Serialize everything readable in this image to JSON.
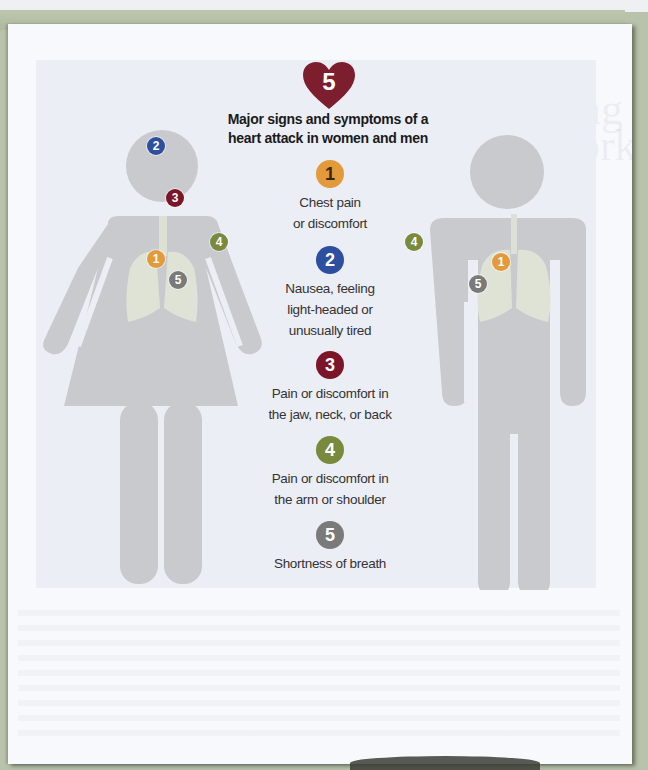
{
  "figure": {
    "heart_number": "5",
    "title_line1": "Major signs and symptoms of a",
    "title_line2": "heart attack in women and men",
    "colors": {
      "heart": "#7c1e2e",
      "s1": "#e39a3a",
      "s2": "#2e4ea0",
      "s3": "#7a1628",
      "s4": "#7a8a3c",
      "s5": "#7a7a7a",
      "figure_gray": "#c9cacd"
    },
    "symptoms": [
      {
        "num": "1",
        "line1": "Chest pain",
        "line2": "or discomfort",
        "line3": ""
      },
      {
        "num": "2",
        "line1": "Nausea, feeling",
        "line2": "light-headed or",
        "line3": "unusually tired"
      },
      {
        "num": "3",
        "line1": "Pain or discomfort in",
        "line2": "the jaw, neck, or back",
        "line3": ""
      },
      {
        "num": "4",
        "line1": "Pain or discomfort in",
        "line2": "the arm or shoulder",
        "line3": ""
      },
      {
        "num": "5",
        "line1": "Shortness of breath",
        "line2": "",
        "line3": ""
      }
    ],
    "woman_markers": [
      "2",
      "3",
      "4",
      "1",
      "5"
    ],
    "man_markers": [
      "4",
      "1",
      "5"
    ]
  },
  "showthrough": {
    "line1": "M",
    "line2": "Writing",
    "line3": "at Work"
  }
}
